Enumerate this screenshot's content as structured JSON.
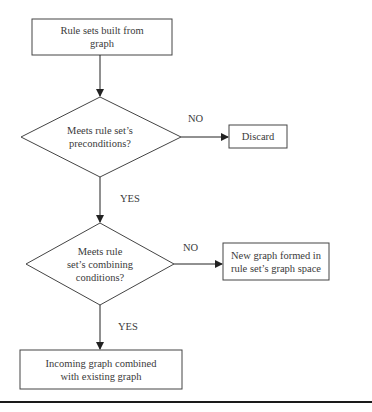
{
  "diagram": {
    "type": "flowchart",
    "nodes": [
      {
        "id": "start",
        "shape": "rectangle",
        "label_lines": [
          "Rule sets built from",
          "graph"
        ]
      },
      {
        "id": "decision1",
        "shape": "diamond",
        "label_lines": [
          "Meets rule set’s",
          "preconditions?"
        ]
      },
      {
        "id": "discard",
        "shape": "rectangle",
        "label_lines": [
          "Discard"
        ]
      },
      {
        "id": "decision2",
        "shape": "diamond",
        "label_lines": [
          "Meets rule",
          "set’s combining",
          "conditions?"
        ]
      },
      {
        "id": "new_graph",
        "shape": "rectangle",
        "label_lines": [
          "New graph formed in",
          "rule set’s graph space"
        ]
      },
      {
        "id": "combined",
        "shape": "rectangle",
        "label_lines": [
          "Incoming graph combined",
          "with existing graph"
        ]
      }
    ],
    "edges": [
      {
        "from": "start",
        "to": "decision1",
        "label": ""
      },
      {
        "from": "decision1",
        "to": "discard",
        "label": "NO"
      },
      {
        "from": "decision1",
        "to": "decision2",
        "label": "YES"
      },
      {
        "from": "decision2",
        "to": "new_graph",
        "label": "NO"
      },
      {
        "from": "decision2",
        "to": "combined",
        "label": "YES"
      }
    ],
    "colors": {
      "stroke": "#3a3a3a",
      "text": "#3a3a3a",
      "background": "#ffffff",
      "rule": "#1a1a1a"
    }
  }
}
